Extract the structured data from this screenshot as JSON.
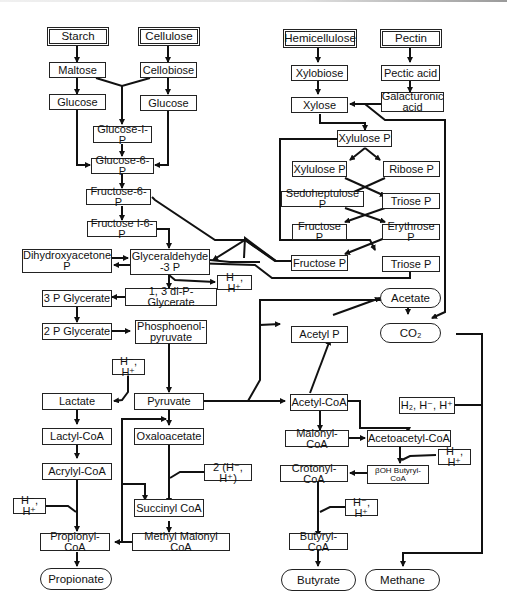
{
  "diagram": {
    "type": "metabolic-pathway",
    "sources": {
      "starch": "Starch",
      "cellulose": "Cellulose",
      "hemicellulose": "Hemicellulose",
      "pectin": "Pectin"
    },
    "nodes": {
      "maltose": "Maltose",
      "cellobiose": "Cellobiose",
      "glucose_left": "Glucose",
      "glucose_right": "Glucose",
      "glucose_1p": "Glucose-I-P",
      "glucose_6p": "Glucose-6-P",
      "fructose_6p": "Fructose-6-P",
      "fructose_16p": "Fructose I-6-P",
      "dihydroxyacetone_p": "Dihydroxyacetone\nP",
      "glyceraldehyde_3p": "Glyceraldehyde\n-3 P",
      "h_pair_1": "H⁻, H⁺",
      "di_p_glycerate": "1, 3 di-P-Glycerate",
      "p3_glycerate": "3 P Glycerate",
      "p2_glycerate": "2 P Glycerate",
      "phosphoenolpyruvate": "Phosphoenol-\npyruvate",
      "h_pair_2": "H⁻, H⁺",
      "lactate": "Lactate",
      "pyruvate": "Pyruvate",
      "lactyl_coa": "Lactyl-CoA",
      "oxaloacetate": "Oxaloacetate",
      "acrylyl_coa": "Acrylyl-CoA",
      "h_pair_x2": "2 (H⁻, H⁺)",
      "h_pair_3": "H⁻, H⁺",
      "succinyl_coa": "Succinyl CoA",
      "propionyl_coa": "Propionyl-CoA",
      "methyl_malonyl_coa": "Methyl Malonyl CoA",
      "xylobiose": "Xylobiose",
      "pectic_acid": "Pectic acid",
      "xylose": "Xylose",
      "galacturonic_acid": "Galacturonic\nacid",
      "xylulose_p_top": "Xylulose P",
      "xylulose_p": "Xylulose P",
      "ribose_p": "Ribose P",
      "sedoheptulose_p": "Sedoheptulose P",
      "triose_p_1": "Triose P",
      "fructose_p_1": "Fructose P",
      "erythrose_p": "Erythrose P",
      "fructose_p_2": "Fructose P",
      "triose_p_2": "Triose P",
      "acetyl_p": "Acetyl P",
      "acetyl_coa": "Acetyl-CoA",
      "h2_pair": "H₂, H⁻, H⁺",
      "malonyl_coa": "Malonyl-CoA",
      "acetoacetyl_coa": "Acetoacetyl-CoA",
      "h_pair_4": "H⁻, H⁺",
      "crotonyl_coa": "Crotonyl-CoA",
      "boh_butyryl_coa": "βOH Butyryl-\nCoA",
      "h_pair_5": "H⁻, H⁺",
      "butyryl_coa": "Butyryl-CoA"
    },
    "products": {
      "acetate": "Acetate",
      "co2": "CO₂",
      "propionate": "Propionate",
      "butyrate": "Butyrate",
      "methane": "Methane"
    },
    "colors": {
      "line": "#111111",
      "border": "#222222",
      "background": "#ffffff"
    }
  }
}
